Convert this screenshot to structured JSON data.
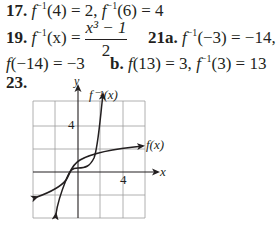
{
  "answers": {
    "a17": {
      "num": "17.",
      "text1": "f",
      "sup": "−1",
      "text2": "(4) = 2, ",
      "text3": "f",
      "sup2": "−1",
      "text4": "(6) = 4"
    },
    "a19": {
      "num": "19.",
      "lhs_f": "f",
      "sup": "−1",
      "lhs_rest": "(x) =",
      "numerator": "x³ − 1",
      "denominator": "2"
    },
    "a21a": {
      "num": "21a.",
      "f": "f",
      "sup": "−1",
      "rest": "(−3) = −14,"
    },
    "a21a_cont": {
      "f": "f",
      "rest": "(−14) = −3"
    },
    "a21b": {
      "num": "b.",
      "f": "f",
      "rest1": "(13) = 3, ",
      "f2": "f",
      "sup": "−1",
      "rest2": "(3) = 13"
    },
    "a23": {
      "num": "23."
    }
  },
  "graph": {
    "x_axis_label": "x",
    "y_axis_label": "y",
    "tick_x": "4",
    "tick_y": "4",
    "curve_f_label": "f(x)",
    "curve_finv_label": "f⁻¹(x)",
    "grid_step": 2,
    "x_range": [
      -6,
      8
    ],
    "y_range": [
      -6,
      8
    ],
    "line_color": "#231f20",
    "grid_color": "#9d9d9d"
  }
}
